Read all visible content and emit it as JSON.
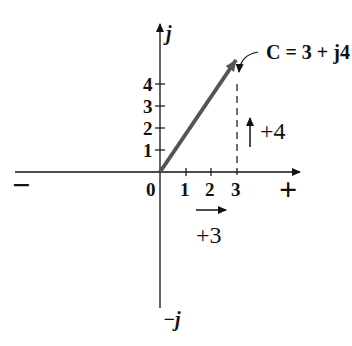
{
  "diagram": {
    "type": "complex-plane",
    "axes": {
      "imag_pos_label": "j",
      "imag_neg_label": "−j",
      "real_pos_label": "+",
      "real_neg_label": "−",
      "origin_label": "0"
    },
    "real_ticks": [
      "1",
      "2",
      "3"
    ],
    "imag_ticks": [
      "1",
      "2",
      "3",
      "4"
    ],
    "vector": {
      "label": "C = 3 + j4",
      "real": 3,
      "imag": 4,
      "color": "#555555"
    },
    "annotations": {
      "real_component": "+3",
      "imag_component": "+4"
    }
  }
}
